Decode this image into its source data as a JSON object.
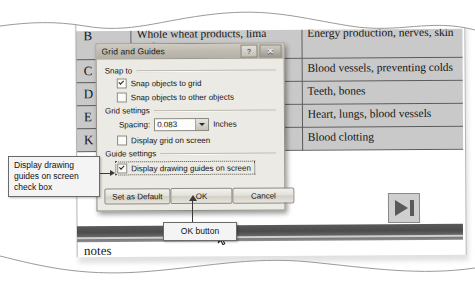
{
  "page": {
    "bottom_label": "notes"
  },
  "table": {
    "columns": [
      "vitamin",
      "food_sources",
      "benefits"
    ],
    "rows": [
      {
        "label": "B",
        "food": "Whole wheat products, lima soybeans",
        "benefit": "Energy production, nerves, skin"
      },
      {
        "label": "C",
        "food": "s, fresh",
        "benefit": "Blood vessels, preventing colds"
      },
      {
        "label": "D",
        "food": ",",
        "benefit": "Teeth, bones"
      },
      {
        "label": "E",
        "food": "lucts,",
        "benefit": "Heart, lungs, blood vessels"
      },
      {
        "label": "K",
        "food": "ables",
        "benefit": "Blood clotting"
      }
    ]
  },
  "next_button": {
    "name": "next-slide",
    "label": ""
  },
  "dialog": {
    "title": "Grid and Guides",
    "help_label": "?",
    "close_label": "✕",
    "groups": {
      "snap_to": {
        "heading": "Snap to",
        "options": [
          {
            "label": "Snap objects to grid",
            "checked": true
          },
          {
            "label": "Snap objects to other objects",
            "checked": false
          }
        ]
      },
      "grid_settings": {
        "heading": "Grid settings",
        "spacing_label": "Spacing:",
        "spacing_value": "0.083",
        "spacing_units": "Inches",
        "display_grid": {
          "label": "Display grid on screen",
          "checked": false
        }
      },
      "guide_settings": {
        "heading": "Guide settings",
        "display_guides": {
          "label": "Display drawing guides on screen",
          "checked": true
        }
      }
    },
    "buttons": {
      "set_default": "Set as Default",
      "ok": "OK",
      "cancel": "Cancel"
    }
  },
  "callouts": {
    "checkbox": "Display drawing guides on screen check box",
    "ok": "OK button"
  }
}
